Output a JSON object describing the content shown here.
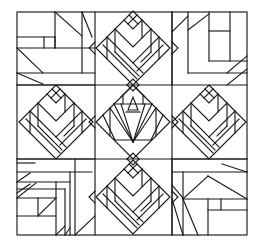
{
  "figure": {
    "type": "quilt-block-line-drawing",
    "colors": {
      "line": "#1a1a1a",
      "background": "#ffffff"
    },
    "frame": {
      "x1": 17,
      "y1": 12,
      "x2": 247,
      "y2": 235
    },
    "grid": {
      "cols": [
        17,
        95,
        172,
        247
      ],
      "rows": [
        12,
        85,
        159,
        235
      ]
    },
    "blocks": [
      {
        "id": "top-left",
        "kind": "log-cabin-corner"
      },
      {
        "id": "top-center",
        "kind": "tulip-diamond"
      },
      {
        "id": "top-right",
        "kind": "log-cabin-corner"
      },
      {
        "id": "middle-left",
        "kind": "tulip-diamond"
      },
      {
        "id": "center",
        "kind": "fan-diamond"
      },
      {
        "id": "middle-right",
        "kind": "tulip-diamond"
      },
      {
        "id": "bottom-left",
        "kind": "log-cabin-corner"
      },
      {
        "id": "bottom-center",
        "kind": "tulip-diamond"
      },
      {
        "id": "bottom-right",
        "kind": "log-cabin-corner"
      }
    ],
    "segments": {
      "top-left": [
        [
          17,
          37,
          55,
          37
        ],
        [
          55,
          37,
          55,
          48
        ],
        [
          17,
          48,
          95,
          48
        ],
        [
          44,
          37,
          44,
          48
        ],
        [
          55,
          12,
          55,
          48
        ],
        [
          55,
          12,
          82,
          36
        ],
        [
          82,
          12,
          82,
          73
        ],
        [
          82,
          12,
          92,
          37
        ],
        [
          17,
          48,
          43,
          73
        ],
        [
          17,
          73,
          95,
          73
        ],
        [
          17,
          73,
          43,
          84
        ],
        [
          17,
          85,
          95,
          85
        ]
      ],
      "top-right": [
        [
          172,
          12,
          172,
          85
        ],
        [
          188,
          12,
          188,
          73
        ],
        [
          172,
          32,
          188,
          16
        ],
        [
          188,
          30,
          209,
          14
        ],
        [
          209,
          12,
          209,
          61
        ],
        [
          209,
          31,
          230,
          31
        ],
        [
          230,
          12,
          230,
          61
        ],
        [
          209,
          61,
          247,
          61
        ],
        [
          188,
          73,
          247,
          73
        ],
        [
          227,
          73,
          247,
          56
        ],
        [
          227,
          85,
          247,
          69
        ]
      ],
      "bottom-left": [
        [
          17,
          159,
          95,
          159
        ],
        [
          17,
          163,
          35,
          163
        ],
        [
          17,
          182,
          30,
          173
        ],
        [
          17,
          193,
          30,
          184
        ],
        [
          17,
          182,
          70,
          182
        ],
        [
          17,
          189,
          65,
          189
        ],
        [
          17,
          198,
          56,
          198
        ],
        [
          17,
          198,
          36,
          183
        ],
        [
          17,
          216,
          56,
          216
        ],
        [
          38,
          198,
          38,
          216
        ],
        [
          38,
          216,
          56,
          198
        ],
        [
          56,
          182,
          56,
          235
        ],
        [
          65,
          189,
          65,
          235
        ],
        [
          70,
          172,
          70,
          235
        ],
        [
          17,
          172,
          92,
          172
        ],
        [
          75,
          159,
          75,
          235
        ],
        [
          56,
          235,
          65,
          226
        ],
        [
          65,
          235,
          70,
          228
        ],
        [
          75,
          235,
          95,
          216
        ]
      ],
      "bottom-right": [
        [
          172,
          159,
          247,
          159
        ],
        [
          172,
          172,
          247,
          172
        ],
        [
          172,
          159,
          172,
          235
        ],
        [
          183,
          172,
          183,
          235
        ],
        [
          222,
          164,
          247,
          172
        ],
        [
          183,
          199,
          208,
          176
        ],
        [
          208,
          176,
          247,
          199
        ],
        [
          183,
          199,
          247,
          199
        ],
        [
          183,
          199,
          198,
          235
        ],
        [
          208,
          199,
          208,
          235
        ],
        [
          208,
          210,
          247,
          210
        ],
        [
          221,
          199,
          221,
          210
        ],
        [
          172,
          185,
          183,
          198
        ],
        [
          172,
          199,
          183,
          235
        ]
      ]
    }
  }
}
